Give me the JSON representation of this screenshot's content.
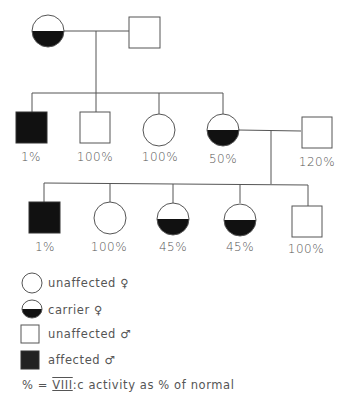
{
  "pedigree": {
    "generation_1": [
      {
        "id": "I-1",
        "sex": "female",
        "status": "carrier",
        "label": ""
      },
      {
        "id": "I-2",
        "sex": "male",
        "status": "unaffected",
        "label": ""
      }
    ],
    "generation_2": [
      {
        "id": "II-1",
        "sex": "male",
        "status": "affected",
        "label": "1%"
      },
      {
        "id": "II-2",
        "sex": "male",
        "status": "unaffected",
        "label": "100%"
      },
      {
        "id": "II-3",
        "sex": "female",
        "status": "unaffected",
        "label": "100%"
      },
      {
        "id": "II-4",
        "sex": "female",
        "status": "carrier",
        "label": "50%"
      },
      {
        "id": "II-5",
        "sex": "male",
        "status": "unaffected",
        "label": "120%",
        "spouse_of": "II-4"
      }
    ],
    "generation_3": [
      {
        "id": "III-1",
        "sex": "male",
        "status": "affected",
        "label": "1%"
      },
      {
        "id": "III-2",
        "sex": "female",
        "status": "unaffected",
        "label": "100%"
      },
      {
        "id": "III-3",
        "sex": "female",
        "status": "carrier",
        "label": "45%"
      },
      {
        "id": "III-4",
        "sex": "female",
        "status": "carrier",
        "label": "45%"
      },
      {
        "id": "III-5",
        "sex": "male",
        "status": "unaffected",
        "label": "100%"
      }
    ]
  },
  "legend": {
    "items": [
      {
        "symbol": "unaffected-female",
        "label": "unaffected ♀"
      },
      {
        "symbol": "carrier-female",
        "label": "carrier ♀"
      },
      {
        "symbol": "unaffected-male",
        "label": "unaffected ♂"
      },
      {
        "symbol": "affected-male",
        "label": "affected ♂"
      }
    ],
    "note_prefix": "% = ",
    "note_factor": "VIII",
    "note_suffix": ":c activity as % of normal"
  },
  "colors": {
    "line": "#555555",
    "fill": "#111111",
    "background": "#ffffff"
  }
}
